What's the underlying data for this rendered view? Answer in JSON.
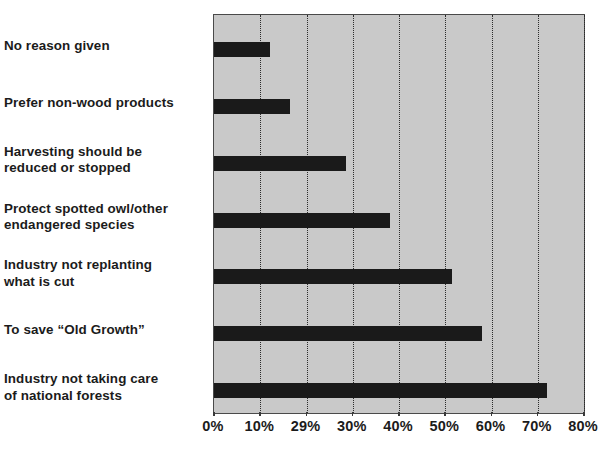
{
  "chart_data": {
    "type": "bar",
    "orientation": "horizontal",
    "title": "",
    "subtitle": "",
    "xlabel": "",
    "ylabel": "",
    "xlim": [
      0,
      80
    ],
    "grid": true,
    "legend": null,
    "categories": [
      "No reason given",
      "Prefer non-wood products",
      "Harvesting should be\nreduced or stopped",
      "Protect spotted owl/other\nendangered species",
      "Industry not replanting\nwhat is cut",
      "To save “Old Growth”",
      "Industry not taking care\nof national forests"
    ],
    "values": [
      12,
      16.5,
      28.5,
      38,
      51.5,
      58,
      72
    ],
    "tick_labels": [
      "0%",
      "10%",
      "29%",
      "30%",
      "40%",
      "50%",
      "60%",
      "70%",
      "80%"
    ],
    "tick_values": [
      0,
      10,
      20,
      30,
      40,
      50,
      60,
      70,
      80
    ],
    "colors": {
      "bar": "#1a1a1a",
      "plot_background": "#c9c9c9",
      "gridline": "#2b2b2b",
      "axis_border": "#4a4a4a",
      "text": "#1b1b1b",
      "page_background": "#ffffff"
    }
  }
}
